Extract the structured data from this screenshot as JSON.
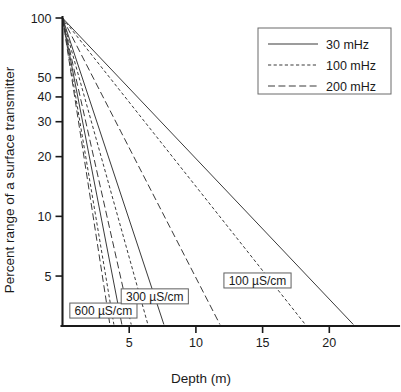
{
  "chart_data": {
    "type": "line",
    "title": "",
    "xlabel": "Depth (m)",
    "ylabel": "Percent range of a surface transmitter",
    "xlim": [
      0,
      23.5
    ],
    "ylim": [
      2.8,
      100
    ],
    "yscale": "log",
    "xscale": "linear",
    "grid": false,
    "xticks": [
      5,
      10,
      15,
      20
    ],
    "xtick_labels": [
      "5",
      "10",
      "15",
      "20"
    ],
    "yticks": [
      100,
      50,
      40,
      30,
      20,
      10,
      5
    ],
    "ytick_labels": [
      "100",
      "50",
      "40",
      "30",
      "20",
      "10",
      "5"
    ],
    "legend_position": "upper right",
    "legend": [
      {
        "label": "30 mHz",
        "style": "solid"
      },
      {
        "label": "100 mHz",
        "style": "dotted"
      },
      {
        "label": "200 mHz",
        "style": "dashed"
      }
    ],
    "annotations": [
      {
        "text": "600 µS/cm",
        "x": 0.55,
        "y": 3.35
      },
      {
        "text": "300 µS/cm",
        "x": 4.4,
        "y": 3.95
      },
      {
        "text": "100 µS/cm",
        "x": 12.1,
        "y": 4.75
      }
    ],
    "series": [
      {
        "name": "100 µS/cm, 30 mHz",
        "conductivity": "100 µS/cm",
        "frequency": "30 mHz",
        "style": "solid",
        "x": [
          0,
          21.8
        ],
        "y": [
          100,
          2.85
        ]
      },
      {
        "name": "100 µS/cm, 100 mHz",
        "conductivity": "100 µS/cm",
        "frequency": "100 mHz",
        "style": "dotted",
        "x": [
          0,
          18.2
        ],
        "y": [
          100,
          2.85
        ]
      },
      {
        "name": "100 µS/cm, 200 mHz",
        "conductivity": "100 µS/cm",
        "frequency": "200 mHz",
        "style": "dashed",
        "x": [
          0,
          11.8
        ],
        "y": [
          100,
          2.85
        ]
      },
      {
        "name": "300 µS/cm, 30 mHz",
        "conductivity": "300 µS/cm",
        "frequency": "30 mHz",
        "style": "solid",
        "x": [
          0,
          7.6
        ],
        "y": [
          100,
          2.85
        ]
      },
      {
        "name": "300 µS/cm, 100 mHz",
        "conductivity": "300 µS/cm",
        "frequency": "100 mHz",
        "style": "dotted",
        "x": [
          0,
          6.4
        ],
        "y": [
          100,
          2.85
        ]
      },
      {
        "name": "300 µS/cm, 200 mHz",
        "conductivity": "300 µS/cm",
        "frequency": "200 mHz",
        "style": "dashed",
        "x": [
          0,
          5.15
        ],
        "y": [
          100,
          2.85
        ]
      },
      {
        "name": "600 µS/cm, 30 mHz",
        "conductivity": "600 µS/cm",
        "frequency": "30 mHz",
        "style": "solid",
        "x": [
          0,
          4.45
        ],
        "y": [
          100,
          2.85
        ]
      },
      {
        "name": "600 µS/cm, 100 mHz",
        "conductivity": "600 µS/cm",
        "frequency": "100 mHz",
        "style": "dotted",
        "x": [
          0,
          3.85
        ],
        "y": [
          100,
          2.85
        ]
      },
      {
        "name": "600 µS/cm, 200 mHz",
        "conductivity": "600 µS/cm",
        "frequency": "200 mHz",
        "style": "dashed",
        "x": [
          0,
          3.55
        ],
        "y": [
          100,
          2.85
        ]
      }
    ],
    "colors": {
      "line": "#3a3a3a",
      "axis": "#1a1a1a",
      "text": "#1a1a1a",
      "background": "#ffffff",
      "box_border": "#5e5e5e"
    }
  }
}
